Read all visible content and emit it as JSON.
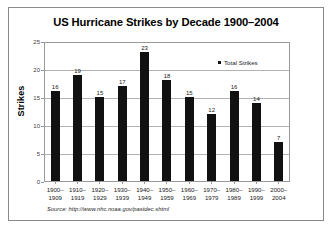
{
  "chart_data": {
    "type": "bar",
    "title": "US Hurricane Strikes by Decade 1900–2004",
    "xlabel": "",
    "ylabel": "Strikes",
    "ylim": [
      0,
      25
    ],
    "yticks": [
      0,
      5,
      10,
      15,
      20,
      25
    ],
    "grid": true,
    "legend_position": "top-right",
    "categories": [
      "1900–\n1909",
      "1910–\n1919",
      "1920–\n1929",
      "1930–\n1939",
      "1940–\n1949",
      "1950–\n1959",
      "1960–\n1969",
      "1970–\n1979",
      "1980–\n1989",
      "1990–\n1999",
      "2000–\n2004"
    ],
    "category_lines": [
      [
        "1900–",
        "1909"
      ],
      [
        "1910–",
        "1919"
      ],
      [
        "1920–",
        "1929"
      ],
      [
        "1930–",
        "1939"
      ],
      [
        "1940–",
        "1949"
      ],
      [
        "1950–",
        "1959"
      ],
      [
        "1960–",
        "1969"
      ],
      [
        "1970–",
        "1979"
      ],
      [
        "1980–",
        "1989"
      ],
      [
        "1990–",
        "1999"
      ],
      [
        "2000–",
        "2004"
      ]
    ],
    "series": [
      {
        "name": "Total Strikes",
        "color": "#111111",
        "values": [
          16,
          19,
          15,
          17,
          23,
          18,
          15,
          12,
          16,
          14,
          7
        ]
      }
    ]
  },
  "legend": {
    "entries": [
      {
        "label": "Total Strikes",
        "color": "#111111"
      }
    ]
  },
  "source": {
    "text": "Source: http://www.nhc.noaa.gov/pastdec.shtml"
  },
  "colors": {
    "bar": "#111111",
    "grid": "#b2b2b2",
    "axis": "#9a9a9a",
    "frame": "#8a8a8a",
    "background": "#ffffff",
    "text": "#000000"
  }
}
